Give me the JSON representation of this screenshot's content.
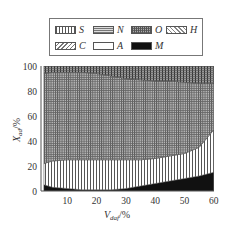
{
  "legend": {
    "items": [
      {
        "key": "S",
        "label": "S",
        "pattern": "vertical-lines"
      },
      {
        "key": "N",
        "label": "N",
        "pattern": "horizontal-lines"
      },
      {
        "key": "O",
        "label": "O",
        "pattern": "dense-grid"
      },
      {
        "key": "H",
        "label": "H",
        "pattern": "diagonal-back"
      },
      {
        "key": "C",
        "label": "C",
        "pattern": "diagonal-forward"
      },
      {
        "key": "A",
        "label": "A",
        "pattern": "blank"
      },
      {
        "key": "M",
        "label": "M",
        "pattern": "solid-black"
      }
    ]
  },
  "axes": {
    "xlabel": "V",
    "xlabel_sub": "daf",
    "xlabel_unit": "/%",
    "ylabel": "X",
    "ylabel_sub": "ad",
    "ylabel_unit": "/%",
    "xticks": [
      "10",
      "20",
      "30",
      "40",
      "50",
      "60"
    ],
    "yticks": [
      "0",
      "20",
      "40",
      "60",
      "80",
      "100"
    ]
  },
  "chart_data": {
    "type": "area",
    "title": "",
    "xlabel": "V_daf/%",
    "ylabel": "X_ad/%",
    "xlim": [
      0,
      60
    ],
    "ylim": [
      0,
      100
    ],
    "stacked": true,
    "grid": false,
    "legend_position": "top",
    "x": [
      2,
      5,
      10,
      15,
      20,
      25,
      30,
      35,
      40,
      45,
      50,
      55,
      60
    ],
    "series": [
      {
        "name": "M",
        "values": [
          5,
          3,
          2,
          1,
          1,
          1,
          2,
          4,
          6,
          8,
          10,
          12,
          15
        ]
      },
      {
        "name": "S",
        "values": [
          17,
          21,
          23,
          24,
          24,
          24,
          23,
          21,
          20,
          20,
          20,
          23,
          34
        ]
      },
      {
        "name": "O",
        "values": [
          72,
          71,
          70,
          70,
          69,
          67,
          65,
          64,
          62,
          60,
          57,
          51,
          37
        ]
      },
      {
        "name": "N",
        "values": [
          6,
          5,
          5,
          5,
          6,
          8,
          10,
          11,
          12,
          12,
          13,
          14,
          14
        ]
      }
    ],
    "boundaries_cumulative": {
      "M_top": [
        5,
        3,
        2,
        1,
        1,
        1,
        2,
        4,
        6,
        8,
        10,
        12,
        15
      ],
      "S_top": [
        22,
        24,
        25,
        25,
        25,
        25,
        25,
        25,
        26,
        28,
        30,
        35,
        49
      ],
      "O_top": [
        94,
        95,
        95,
        95,
        94,
        92,
        90,
        89,
        88,
        88,
        87,
        86,
        86
      ],
      "N_top": [
        100,
        100,
        100,
        100,
        100,
        100,
        100,
        100,
        100,
        100,
        100,
        100,
        100
      ]
    }
  }
}
